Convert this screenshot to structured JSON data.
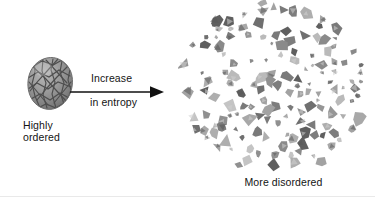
{
  "figure": {
    "type": "diagram",
    "background_color": "#ffffff",
    "text_color": "#141414"
  },
  "left_panel": {
    "object_name": "ordered-crystal-sphere",
    "description": "gray sphere with crystalline lattice network",
    "fill_color": "#8d8d8d",
    "line_color": "#4a4a4a",
    "caption_lines": [
      "Highly",
      "ordered"
    ]
  },
  "arrow": {
    "name": "increase-in-entropy-arrow",
    "direction": "right",
    "color": "#111111",
    "label_above": "Increase",
    "label_below": "in entropy"
  },
  "right_panel": {
    "object_name": "disordered-fragment-cloud",
    "description": "scattered gray polygonal fragments",
    "fragment_count": 148,
    "fill_color": "#9a9a9a",
    "caption_lines": [
      "More disordered"
    ]
  },
  "divider": {
    "name": "bottom-rule",
    "color": "#e9e9e9"
  }
}
